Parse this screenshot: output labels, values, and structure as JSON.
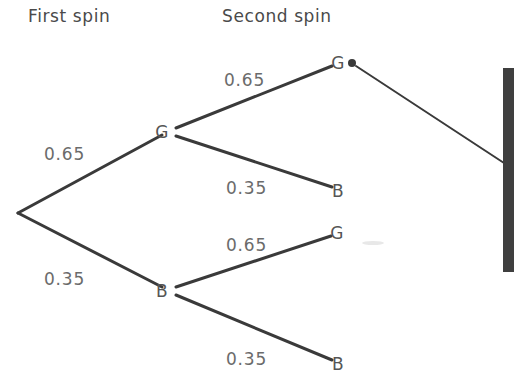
{
  "diagram": {
    "title_first": "First spin",
    "title_second": "Second spin",
    "headings": [
      {
        "label": "First spin",
        "x": 28,
        "y": 22
      },
      {
        "label": "Second spin",
        "x": 222,
        "y": 22
      }
    ],
    "root": {
      "x": 18,
      "y": 213
    },
    "first_spin_branches": [
      {
        "outcome": "G",
        "probability": "0.65",
        "node_x": 168,
        "node_y": 131,
        "label_x": 44,
        "label_y": 160
      },
      {
        "outcome": "B",
        "probability": "0.35",
        "node_x": 168,
        "node_y": 290,
        "label_x": 44,
        "label_y": 285
      }
    ],
    "second_spin_branches": [
      {
        "parent": "G",
        "outcome": "G",
        "probability": "0.65",
        "node_x": 338,
        "node_y": 62,
        "label_x": 224,
        "label_y": 86,
        "has_dot": true
      },
      {
        "parent": "G",
        "outcome": "B",
        "probability": "0.35",
        "node_x": 338,
        "node_y": 190,
        "label_x": 226,
        "label_y": 194,
        "has_dot": false
      },
      {
        "parent": "B",
        "outcome": "G",
        "probability": "0.65",
        "node_x": 337,
        "node_y": 232,
        "label_x": 226,
        "label_y": 251,
        "has_dot": false
      },
      {
        "parent": "B",
        "outcome": "B",
        "probability": "0.35",
        "node_x": 338,
        "node_y": 363,
        "label_x": 226,
        "label_y": 365,
        "has_dot": false
      }
    ],
    "marker_dot": {
      "x": 352,
      "y": 63,
      "r": 4
    },
    "trailing_line": {
      "x1": 356,
      "y1": 66,
      "x2": 504,
      "y2": 163
    },
    "page_edge_bar": {
      "x": 503,
      "y": 68,
      "width": 11,
      "height": 204
    },
    "colors": {
      "background": "#ffffff",
      "branch": "#3a3a3a",
      "node_text": "#555555",
      "probability_text": "#6b6b6b",
      "heading_text": "#4a4a4a",
      "page_edge": "#3f3f3f"
    }
  }
}
